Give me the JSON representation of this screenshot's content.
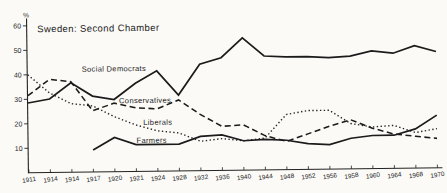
{
  "page": {
    "paper_color": "#fbfaf7",
    "ink_color": "#222222"
  },
  "chart_data": {
    "type": "line",
    "title": "Sweden: Second Chamber",
    "ylabel": "%",
    "xlabel": "",
    "ylim": [
      0,
      62
    ],
    "yticks": [
      10,
      20,
      30,
      40,
      50,
      60
    ],
    "grid": false,
    "legend_position": "inline-labels",
    "categories": [
      "1911",
      "1914",
      "1914",
      "1917",
      "1920",
      "1921",
      "1924",
      "1928",
      "1932",
      "1936",
      "1940",
      "1944",
      "1948",
      "1952",
      "1956",
      "1958",
      "1960",
      "1964",
      "1968",
      "1970"
    ],
    "series": [
      {
        "name": "Social Democrats",
        "line_style": "solid",
        "color": "#1b1b1b",
        "label_pos": {
          "x": 82,
          "y": 70
        },
        "values": [
          28.5,
          30,
          36.5,
          31,
          29.5,
          36,
          41,
          31,
          43.5,
          46,
          54,
          46.5,
          46,
          46,
          45.5,
          46,
          48,
          47,
          50,
          47.5
        ]
      },
      {
        "name": "Conservatives",
        "line_style": "dashed",
        "color": "#1b1b1b",
        "label_pos": {
          "x": 119,
          "y": 102
        },
        "values": [
          31.5,
          38,
          37,
          25,
          28,
          26,
          25.5,
          29,
          23,
          18,
          18.5,
          14,
          11.5,
          14.5,
          17.5,
          20,
          16.5,
          14,
          13,
          12
        ]
      },
      {
        "name": "Liberals",
        "line_style": "dotted",
        "color": "#262626",
        "label_pos": {
          "x": 143,
          "y": 124
        },
        "values": [
          40,
          32.5,
          28,
          27,
          22.5,
          19,
          16.5,
          15.5,
          12,
          13,
          12,
          13,
          22.5,
          24,
          24,
          18.5,
          17,
          17.5,
          14.5,
          16
        ]
      },
      {
        "name": "Farmers",
        "line_style": "solid",
        "color": "#1b1b1b",
        "label_pos": {
          "x": 136,
          "y": 142
        },
        "values": [
          null,
          null,
          null,
          9,
          14,
          11,
          11,
          11,
          14,
          14.5,
          12,
          12.5,
          12,
          10.5,
          10,
          12.5,
          13.5,
          13.5,
          16,
          21.5
        ]
      }
    ]
  }
}
